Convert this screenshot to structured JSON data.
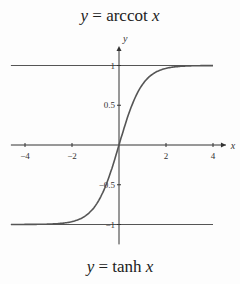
{
  "titles": {
    "top": {
      "prefix": "y",
      "eq": " = arccot ",
      "var": "x"
    },
    "bottom": {
      "prefix": "y",
      "eq": " = tanh ",
      "var": "x"
    }
  },
  "colors": {
    "axis": "#333333",
    "curve": "#555555",
    "asymptote": "#555555"
  },
  "chart_data": {
    "type": "line",
    "title": "y = tanh x",
    "top_caption": "y = arccot x",
    "xlabel": "x",
    "ylabel": "y",
    "xlim": [
      -4.5,
      4.5
    ],
    "ylim": [
      -1.2,
      1.2
    ],
    "x_ticks": [
      -4,
      -2,
      2,
      4
    ],
    "x_tick_labels": [
      "−4",
      "−2",
      "2",
      "4"
    ],
    "y_ticks": [
      1,
      0.5,
      -0.5,
      -1
    ],
    "y_tick_labels": [
      "1",
      "0.5",
      "−0.5",
      "−1"
    ],
    "asymptotes": [
      1,
      -1
    ],
    "grid": false,
    "series": [
      {
        "name": "tanh x",
        "x": [
          -4,
          -3,
          -2,
          -1.5,
          -1,
          -0.5,
          0,
          0.5,
          1,
          1.5,
          2,
          3,
          4
        ],
        "y": [
          -0.999,
          -0.995,
          -0.964,
          -0.905,
          -0.762,
          -0.462,
          0,
          0.462,
          0.762,
          0.905,
          0.964,
          0.995,
          0.999
        ]
      }
    ]
  }
}
